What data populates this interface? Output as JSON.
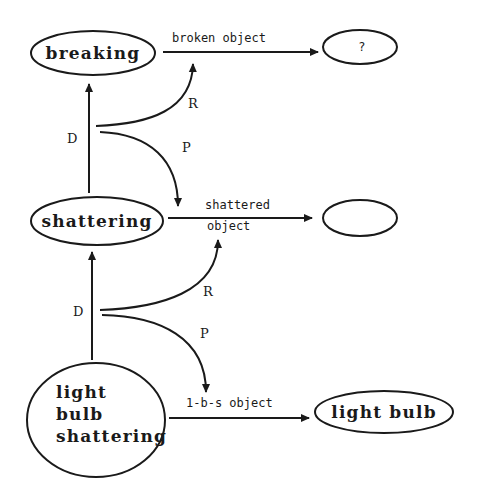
{
  "diagram": {
    "type": "concept-hierarchy",
    "colors": {
      "stroke": "#1a1a1a",
      "background": "#ffffff"
    },
    "nodes": {
      "breaking": {
        "label": "breaking"
      },
      "unknown_result": {
        "label": "?"
      },
      "shattering": {
        "label": "shattering"
      },
      "empty_result": {
        "label": ""
      },
      "light_bulb_shattering": {
        "lines": [
          "light",
          "bulb",
          "shattering"
        ]
      },
      "light_bulb": {
        "label": "light bulb"
      }
    },
    "edges": {
      "broken_object": {
        "label": "broken object",
        "from": "breaking",
        "to": "?"
      },
      "shattered_object": {
        "lines": [
          "shattered",
          "object"
        ],
        "from": "shattering",
        "to": "(empty)"
      },
      "lbs_object": {
        "label": "1-b-s object",
        "from": "light bulb shattering",
        "to": "light bulb"
      }
    },
    "relations": {
      "upper": {
        "d_label": "D",
        "r_label": "R",
        "p_label": "P"
      },
      "lower": {
        "d_label": "D",
        "r_label": "R",
        "p_label": "P"
      }
    }
  }
}
